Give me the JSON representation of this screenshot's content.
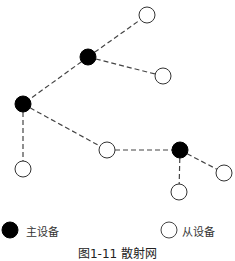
{
  "diagram": {
    "title": "散射网",
    "caption": "图1-11  散射网",
    "colors": {
      "master_fill": "#000000",
      "slave_fill": "#ffffff",
      "stroke": "#333333",
      "edge": "#444444"
    },
    "node_radius": 8,
    "nodes": [
      {
        "id": "m1",
        "type": "master",
        "x": 88,
        "y": 57
      },
      {
        "id": "m2",
        "type": "master",
        "x": 23,
        "y": 104
      },
      {
        "id": "m3",
        "type": "master",
        "x": 180,
        "y": 150
      },
      {
        "id": "s1",
        "type": "slave",
        "x": 147,
        "y": 15
      },
      {
        "id": "s2",
        "type": "slave",
        "x": 163,
        "y": 76
      },
      {
        "id": "s3",
        "type": "slave",
        "x": 23,
        "y": 169
      },
      {
        "id": "s4",
        "type": "slave",
        "x": 107,
        "y": 150
      },
      {
        "id": "s5",
        "type": "slave",
        "x": 179,
        "y": 192
      },
      {
        "id": "s6",
        "type": "slave",
        "x": 224,
        "y": 173
      }
    ],
    "edges": [
      {
        "from": "m1",
        "to": "s1",
        "style": "dashed"
      },
      {
        "from": "m1",
        "to": "s2",
        "style": "dashed"
      },
      {
        "from": "m1",
        "to": "m2",
        "style": "dashed"
      },
      {
        "from": "m2",
        "to": "s3",
        "style": "dashed"
      },
      {
        "from": "m2",
        "to": "s4",
        "style": "dashed"
      },
      {
        "from": "s4",
        "to": "m3",
        "style": "dashed"
      },
      {
        "from": "m3",
        "to": "s5",
        "style": "dashed"
      },
      {
        "from": "m3",
        "to": "s6",
        "style": "dashed"
      }
    ]
  },
  "legend": {
    "master_label": "主设备",
    "slave_label": "从设备"
  }
}
